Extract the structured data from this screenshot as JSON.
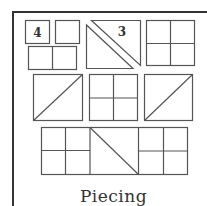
{
  "diagram": {
    "title": "Piecing",
    "frame_color": "#333333",
    "line_color": "#555555",
    "background": "#ffffff",
    "pieces": [
      {
        "id": "square-4",
        "label": "4",
        "shape": "square"
      },
      {
        "id": "square-plain",
        "label": "",
        "shape": "square"
      },
      {
        "id": "rectangle-split",
        "label": "",
        "shape": "two-patch rectangle"
      },
      {
        "id": "triangle-pair-3",
        "label": "3",
        "shape": "separated half-square triangles"
      },
      {
        "id": "four-patch-top-right",
        "label": "",
        "shape": "four-patch"
      },
      {
        "id": "half-square-triangle-left",
        "label": "",
        "shape": "half-square triangle"
      },
      {
        "id": "four-patch-center",
        "label": "",
        "shape": "four-patch"
      },
      {
        "id": "half-square-triangle-right",
        "label": "",
        "shape": "half-square triangle"
      },
      {
        "id": "row-unit-bottom",
        "label": "",
        "shape": "four-patch + half-square triangle + four-patch row"
      }
    ]
  }
}
